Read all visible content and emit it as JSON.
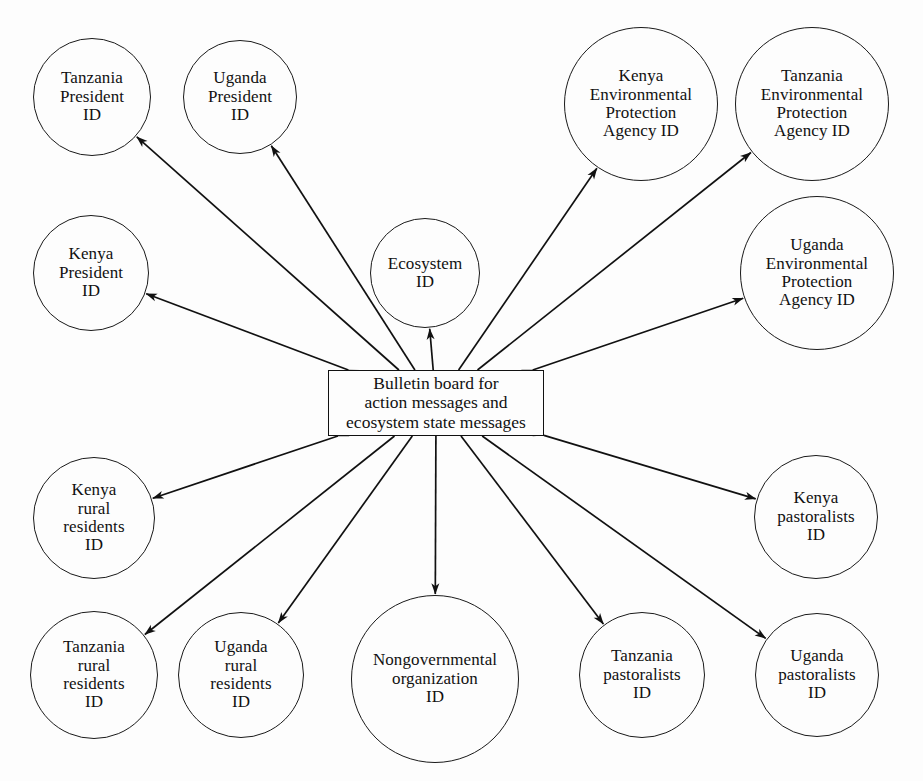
{
  "figure": {
    "type": "agent-communication-diagram",
    "background_color": "#fdfdfd",
    "stroke_color": "#111111",
    "width": 923,
    "height": 781,
    "cropped_caption_sliver": ""
  },
  "hub": {
    "name": "bulletin-board",
    "label": "Bulletin board for\naction messages and\necosystem state messages",
    "shape": "rectangle",
    "x": 328,
    "y": 370,
    "width": 216,
    "height": 66
  },
  "nodes": [
    {
      "id": "tanzania-president",
      "label": "Tanzania\nPresident\nID",
      "cx": 92,
      "cy": 97,
      "r": 59,
      "size": "small"
    },
    {
      "id": "uganda-president",
      "label": "Uganda\nPresident\nID",
      "cx": 240,
      "cy": 97,
      "r": 57,
      "size": "small"
    },
    {
      "id": "kenya-epa",
      "label": "Kenya\nEnvironmental\nProtection\nAgency ID",
      "cx": 641,
      "cy": 104,
      "r": 77,
      "size": "wide"
    },
    {
      "id": "tanzania-epa",
      "label": "Tanzania\nEnvironmental\nProtection\nAgency ID",
      "cx": 812,
      "cy": 104,
      "r": 77,
      "size": "wide"
    },
    {
      "id": "kenya-president",
      "label": "Kenya\nPresident\nID",
      "cx": 91,
      "cy": 273,
      "r": 58,
      "size": "small"
    },
    {
      "id": "ecosystem",
      "label": "Ecosystem\nID",
      "cx": 425,
      "cy": 273,
      "r": 55,
      "size": "small"
    },
    {
      "id": "uganda-epa",
      "label": "Uganda\nEnvironmental\nProtection\nAgency ID",
      "cx": 817,
      "cy": 273,
      "r": 77,
      "size": "wide"
    },
    {
      "id": "kenya-rural",
      "label": "Kenya\nrural\nresidents\nID",
      "cx": 94,
      "cy": 518,
      "r": 61,
      "size": "small"
    },
    {
      "id": "kenya-pastoralists",
      "label": "Kenya\npastoralists\nID",
      "cx": 816,
      "cy": 517,
      "r": 62,
      "size": "small"
    },
    {
      "id": "tanzania-rural",
      "label": "Tanzania\nrural\nresidents\nID",
      "cx": 94,
      "cy": 675,
      "r": 64,
      "size": "small"
    },
    {
      "id": "uganda-rural",
      "label": "Uganda\nrural\nresidents\nID",
      "cx": 241,
      "cy": 675,
      "r": 63,
      "size": "small"
    },
    {
      "id": "ngo",
      "label": "Nongovernmental\norganization\nID",
      "cx": 435,
      "cy": 679,
      "r": 84,
      "size": "wide"
    },
    {
      "id": "tanzania-pastoralists",
      "label": "Tanzania\npastoralists\nID",
      "cx": 642,
      "cy": 675,
      "r": 63,
      "size": "small"
    },
    {
      "id": "uganda-pastoralists",
      "label": "Uganda\npastoralists\nID",
      "cx": 817,
      "cy": 675,
      "r": 62,
      "size": "small"
    }
  ],
  "edges": [
    {
      "from": "bulletin-board",
      "to": "tanzania-president",
      "arrowheads": "both"
    },
    {
      "from": "bulletin-board",
      "to": "uganda-president",
      "arrowheads": "both"
    },
    {
      "from": "bulletin-board",
      "to": "kenya-president",
      "arrowheads": "both"
    },
    {
      "from": "bulletin-board",
      "to": "ecosystem",
      "arrowheads": "both"
    },
    {
      "from": "bulletin-board",
      "to": "kenya-epa",
      "arrowheads": "both"
    },
    {
      "from": "bulletin-board",
      "to": "tanzania-epa",
      "arrowheads": "both"
    },
    {
      "from": "bulletin-board",
      "to": "uganda-epa",
      "arrowheads": "both"
    },
    {
      "from": "bulletin-board",
      "to": "kenya-rural",
      "arrowheads": "both"
    },
    {
      "from": "bulletin-board",
      "to": "tanzania-rural",
      "arrowheads": "both"
    },
    {
      "from": "bulletin-board",
      "to": "uganda-rural",
      "arrowheads": "both"
    },
    {
      "from": "bulletin-board",
      "to": "ngo",
      "arrowheads": "both"
    },
    {
      "from": "bulletin-board",
      "to": "tanzania-pastoralists",
      "arrowheads": "both"
    },
    {
      "from": "bulletin-board",
      "to": "uganda-pastoralists",
      "arrowheads": "both"
    },
    {
      "from": "bulletin-board",
      "to": "kenya-pastoralists",
      "arrowheads": "both"
    }
  ]
}
